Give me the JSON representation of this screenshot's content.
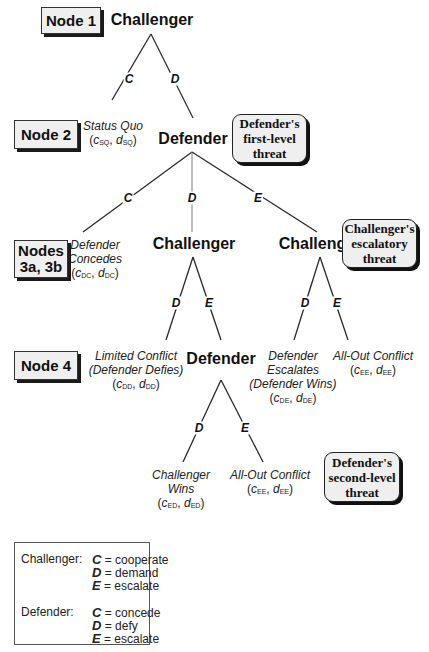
{
  "nodes": {
    "node1": "Node 1",
    "node2": "Node 2",
    "node3_line1": "Nodes",
    "node3_line2": "3a, 3b",
    "node4": "Node 4"
  },
  "players": {
    "n1": "Challenger",
    "n2": "Defender",
    "n3a": "Challenger",
    "n3b": "Challenger",
    "n4": "Defender"
  },
  "branches": {
    "n1_left": "C",
    "n1_right": "D",
    "n2_left": "C",
    "n2_mid": "D",
    "n2_right": "E",
    "n3a_left": "D",
    "n3a_right": "E",
    "n3b_left": "D",
    "n3b_right": "E",
    "n4_left": "D",
    "n4_right": "E"
  },
  "outcomes": {
    "sq": {
      "line1": "Status Quo",
      "c": "c",
      "csub": "SQ",
      "d": "d",
      "dsub": "SQ"
    },
    "dc": {
      "line1": "Defender",
      "line2": "Concedes",
      "c": "c",
      "csub": "DC",
      "d": "d",
      "dsub": "DC"
    },
    "dd": {
      "line1": "Limited Conflict",
      "line2": "(Defender Defies)",
      "c": "c",
      "csub": "DD",
      "d": "d",
      "dsub": "DD"
    },
    "de": {
      "line1": "Defender",
      "line2": "Escalates",
      "line3": "(Defender Wins)",
      "c": "c",
      "csub": "DE",
      "d": "d",
      "dsub": "DE"
    },
    "ee1": {
      "line1": "All-Out Conflict",
      "c": "c",
      "csub": "EE",
      "d": "d",
      "dsub": "EE"
    },
    "ed": {
      "line1": "Challenger",
      "line2": "Wins",
      "c": "c",
      "csub": "ED",
      "d": "d",
      "dsub": "ED"
    },
    "ee2": {
      "line1": "All-Out Conflict",
      "c": "c",
      "csub": "EE",
      "d": "d",
      "dsub": "EE"
    }
  },
  "threats": {
    "first": {
      "line1": "Defender's",
      "line2": "first-level",
      "line3": "threat"
    },
    "escalatory": {
      "line1": "Challenger's",
      "line2": "escalatory",
      "line3": "threat"
    },
    "second": {
      "line1": "Defender's",
      "line2": "second-level",
      "line3": "threat"
    }
  },
  "legend": {
    "challenger_label": "Challenger:",
    "challenger": [
      {
        "key": "C",
        "text": "= cooperate"
      },
      {
        "key": "D",
        "text": "= demand"
      },
      {
        "key": "E",
        "text": "= escalate"
      }
    ],
    "defender_label": "Defender:",
    "defender": [
      {
        "key": "C",
        "text": "= concede"
      },
      {
        "key": "D",
        "text": "= defy"
      },
      {
        "key": "E",
        "text": "= escalate"
      }
    ]
  },
  "colors": {
    "line": "#2a2a2a",
    "mid_line": "#9a9a9a",
    "box_fill": "#efefef"
  }
}
